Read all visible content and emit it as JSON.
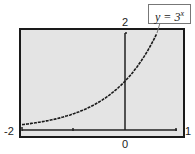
{
  "chart_data": {
    "type": "line",
    "title": "",
    "annotation": "y = 3^x",
    "function": "y = 3^x",
    "xlabel": "",
    "ylabel": "",
    "xlim": [
      -2,
      1
    ],
    "ylim": [
      0,
      2
    ],
    "tick_labels": {
      "xmin": "-2",
      "xmax": "1",
      "x_origin": "0",
      "ymax": "2"
    },
    "x": [
      -2,
      -1.5,
      -1,
      -0.5,
      0,
      0.25,
      0.5,
      0.63
    ],
    "y": [
      0.111,
      0.192,
      0.333,
      0.577,
      1,
      1.316,
      1.732,
      2.0
    ],
    "grid": false,
    "legend": "none"
  },
  "labels": {
    "ymax": "2",
    "xmin": "-2",
    "xmax": "1",
    "origin": "0",
    "callout_base": "y = 3",
    "callout_exp": "x"
  }
}
